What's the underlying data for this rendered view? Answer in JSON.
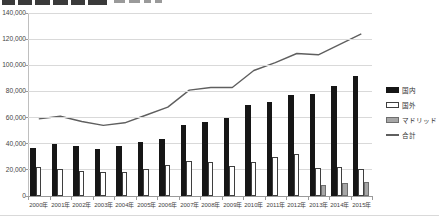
{
  "window": {
    "title_clipped": true,
    "title_note": "bold chart title cut off at top edge of screenshot"
  },
  "colors": {
    "domestic_bar": "#161616",
    "foreign_bar": "#ffffff",
    "madrid_bar": "#a6a6a6",
    "total_line": "#5f5f5f",
    "gridline": "#d9d9d9"
  },
  "chart_data": {
    "type": "bar",
    "combo": "clustered-bar-with-line",
    "title": "",
    "xlabel": "",
    "ylabel": "",
    "grid": true,
    "legend_position": "right",
    "ylim": [
      0,
      140000
    ],
    "y_tick_step": 20000,
    "y_tick_labels": [
      "0",
      "20,000",
      "40,000",
      "60,000",
      "80,000",
      "100,000",
      "120,000",
      "140,000"
    ],
    "categories": [
      "2000年",
      "2001年",
      "2002年",
      "2003年",
      "2004年",
      "2005年",
      "2006年",
      "2007年",
      "2008年",
      "2009年",
      "2010年",
      "2011年",
      "2012年",
      "2013年",
      "2014年",
      "2015年"
    ],
    "series": [
      {
        "name": "国内",
        "type": "bar",
        "color": "#161616",
        "values": [
          37000,
          40000,
          38000,
          36000,
          38000,
          41000,
          44000,
          54000,
          57000,
          60000,
          70000,
          72000,
          77000,
          78000,
          84000,
          92000
        ]
      },
      {
        "name": "国外",
        "type": "bar",
        "color": "#ffffff",
        "values": [
          22000,
          21000,
          19000,
          18000,
          18000,
          21000,
          24000,
          27000,
          26000,
          23000,
          26000,
          30000,
          32000,
          21500,
          22000,
          21000
        ]
      },
      {
        "name": "マドリッド",
        "type": "bar",
        "color": "#a6a6a6",
        "values": [
          0,
          0,
          0,
          0,
          0,
          0,
          0,
          0,
          0,
          0,
          0,
          0,
          0,
          8500,
          10000,
          11000
        ]
      },
      {
        "name": "合計",
        "type": "line",
        "color": "#5f5f5f",
        "values": [
          59000,
          61000,
          57000,
          54000,
          56000,
          62000,
          68000,
          81000,
          83000,
          83000,
          96000,
          102000,
          109000,
          108000,
          116000,
          124000
        ]
      }
    ]
  },
  "legend": {
    "items": [
      {
        "label": "国内",
        "marker": "black-filled-swatch"
      },
      {
        "label": "国外",
        "marker": "white-outlined-swatch"
      },
      {
        "label": "マドリッド",
        "marker": "gray-filled-swatch"
      },
      {
        "label": "合計",
        "marker": "line-swatch"
      }
    ]
  }
}
